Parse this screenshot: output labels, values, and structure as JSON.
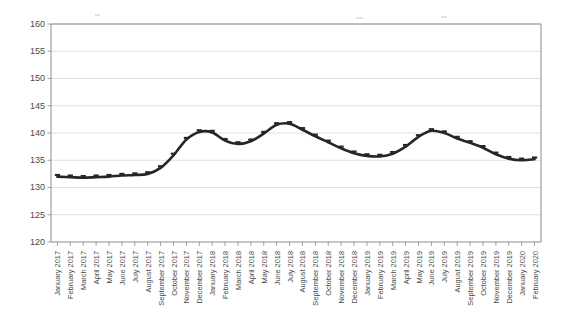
{
  "chart_data": {
    "type": "line",
    "title": "",
    "subtitle": "",
    "xlabel": "",
    "ylabel": "",
    "ylim": [
      120,
      160
    ],
    "ytick_values": [
      120,
      125,
      130,
      135,
      140,
      145,
      150,
      155,
      160
    ],
    "ytick_labels": [
      "120",
      "125",
      "130",
      "135",
      "140",
      "145",
      "150",
      "155",
      "160"
    ],
    "grid": true,
    "legend": false,
    "legend_position": "none",
    "marker": "cross",
    "line_color": "#262626",
    "grid_color": "#d9d9d9",
    "axis_color": "#8c8c8c",
    "categories": [
      "January 2017",
      "February 2017",
      "March 2017",
      "April 2017",
      "May 2017",
      "June 2017",
      "July 2017",
      "August 2017",
      "September 2017",
      "October 2017",
      "November 2017",
      "December 2017",
      "January 2018",
      "February 2018",
      "March 2018",
      "April 2018",
      "May 2018",
      "June 2018",
      "July 2018",
      "August 2018",
      "September 2018",
      "October 2018",
      "November 2018",
      "December 2018",
      "January 2019",
      "February 2019",
      "March 2019",
      "April 2019",
      "May 2019",
      "June 2019",
      "July 2019",
      "August 2019",
      "September 2019",
      "October 2019",
      "November 2019",
      "December 2019",
      "January 2020",
      "February 2020"
    ],
    "series": [
      {
        "name": "Index",
        "values": [
          132.0,
          131.9,
          131.8,
          131.9,
          132.0,
          132.2,
          132.3,
          132.5,
          133.6,
          135.9,
          138.8,
          140.2,
          140.1,
          138.6,
          138.0,
          138.5,
          139.9,
          141.5,
          141.7,
          140.6,
          139.4,
          138.3,
          137.2,
          136.3,
          135.8,
          135.7,
          136.2,
          137.5,
          139.3,
          140.4,
          140.0,
          139.0,
          138.2,
          137.3,
          136.1,
          135.3,
          135.0,
          135.2
        ]
      }
    ]
  }
}
